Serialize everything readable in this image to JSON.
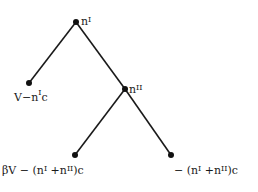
{
  "diagram": {
    "type": "game-tree",
    "nodes": [
      {
        "id": "root",
        "label_base": "n",
        "label_sup": "I"
      },
      {
        "id": "node2",
        "label_base": "n",
        "label_sup": "II"
      }
    ],
    "leaves": {
      "left": {
        "pre": "V−n",
        "sup": "I",
        "post": "c"
      },
      "bottom_left": {
        "pre": "βV − (n",
        "sup1": "I",
        "mid": " +n",
        "sup2": "II",
        "post": ")c"
      },
      "bottom_right": {
        "pre": "− (n",
        "sup1": "I",
        "mid": " +n",
        "sup2": "II",
        "post": ")c"
      }
    },
    "colors": {
      "line": "#1a1a1a",
      "node": "#111111"
    }
  }
}
